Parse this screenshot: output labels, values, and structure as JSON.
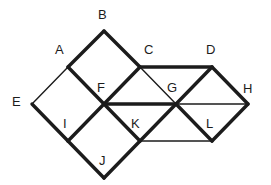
{
  "figure": {
    "type": "geometry-diagram",
    "background_color": "#ffffff",
    "stroke_color": "#1c1c1c",
    "thin_stroke_width": 1.4,
    "thick_stroke_width": 3.4,
    "canvas": {
      "width": 271,
      "height": 185
    }
  },
  "vertices": [
    {
      "id": "A",
      "label": "A",
      "x": 68,
      "y": 67,
      "label_x": 55,
      "label_y": 43
    },
    {
      "id": "B",
      "label": "B",
      "x": 104,
      "y": 31,
      "label_x": 98,
      "label_y": 8
    },
    {
      "id": "C",
      "label": "C",
      "x": 140,
      "y": 67,
      "label_x": 144,
      "label_y": 43
    },
    {
      "id": "D",
      "label": "D",
      "x": 212,
      "y": 67,
      "label_x": 206,
      "label_y": 43
    },
    {
      "id": "E",
      "label": "E",
      "x": 32,
      "y": 104,
      "label_x": 12,
      "label_y": 95
    },
    {
      "id": "F",
      "label": "F",
      "x": 104,
      "y": 104,
      "label_x": 97,
      "label_y": 81
    },
    {
      "id": "G",
      "label": "G",
      "x": 176,
      "y": 104,
      "label_x": 167,
      "label_y": 81
    },
    {
      "id": "H",
      "label": "H",
      "x": 248,
      "y": 104,
      "label_x": 243,
      "label_y": 82
    },
    {
      "id": "I",
      "label": "I",
      "x": 68,
      "y": 141,
      "label_x": 63,
      "label_y": 117
    },
    {
      "id": "J",
      "label": "J",
      "x": 104,
      "y": 178,
      "label_x": 99,
      "label_y": 154
    },
    {
      "id": "K",
      "label": "K",
      "x": 140,
      "y": 141,
      "label_x": 131,
      "label_y": 117
    },
    {
      "id": "L",
      "label": "L",
      "x": 212,
      "y": 141,
      "label_x": 206,
      "label_y": 117
    }
  ],
  "edges": [
    {
      "from": "A",
      "to": "B",
      "weight": "thick"
    },
    {
      "from": "B",
      "to": "C",
      "weight": "thick"
    },
    {
      "from": "C",
      "to": "D",
      "weight": "thick"
    },
    {
      "from": "D",
      "to": "H",
      "weight": "thick"
    },
    {
      "from": "H",
      "to": "L",
      "weight": "thick"
    },
    {
      "from": "E",
      "to": "I",
      "weight": "thick"
    },
    {
      "from": "I",
      "to": "J",
      "weight": "thick"
    },
    {
      "from": "J",
      "to": "K",
      "weight": "thick"
    },
    {
      "from": "A",
      "to": "F",
      "weight": "thick"
    },
    {
      "from": "C",
      "to": "F",
      "weight": "thick"
    },
    {
      "from": "F",
      "to": "G",
      "weight": "thick"
    },
    {
      "from": "F",
      "to": "K",
      "weight": "thick"
    },
    {
      "from": "I",
      "to": "F",
      "weight": "thick"
    },
    {
      "from": "K",
      "to": "G",
      "weight": "thick"
    },
    {
      "from": "G",
      "to": "D",
      "weight": "thick"
    },
    {
      "from": "G",
      "to": "L",
      "weight": "thick"
    },
    {
      "from": "A",
      "to": "E",
      "weight": "thin"
    },
    {
      "from": "C",
      "to": "G",
      "weight": "thin"
    },
    {
      "from": "G",
      "to": "H",
      "weight": "thin"
    },
    {
      "from": "K",
      "to": "L",
      "weight": "thin"
    }
  ]
}
